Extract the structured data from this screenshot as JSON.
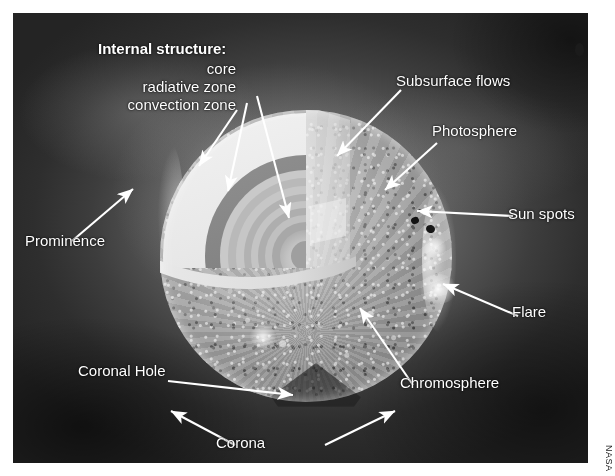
{
  "figure": {
    "credit": "NASA"
  },
  "internal_structure": {
    "heading": "Internal structure:",
    "layers": [
      {
        "id": "core",
        "label": "core"
      },
      {
        "id": "radiative-zone",
        "label": "radiative zone"
      },
      {
        "id": "convection-zone",
        "label": "convection zone"
      }
    ]
  },
  "features": [
    {
      "id": "subsurface-flows",
      "label": "Subsurface flows"
    },
    {
      "id": "photosphere",
      "label": "Photosphere"
    },
    {
      "id": "sun-spots",
      "label": "Sun spots"
    },
    {
      "id": "flare",
      "label": "Flare"
    },
    {
      "id": "chromosphere",
      "label": "Chromosphere"
    },
    {
      "id": "coronal-hole",
      "label": "Coronal Hole"
    },
    {
      "id": "corona",
      "label": "Corona"
    },
    {
      "id": "prominence",
      "label": "Prominence"
    }
  ],
  "colors": {
    "annotation": "#ffffff",
    "plate_background": "#2a2a2a",
    "page_background": "#ffffff",
    "sunspot": "#121212"
  }
}
